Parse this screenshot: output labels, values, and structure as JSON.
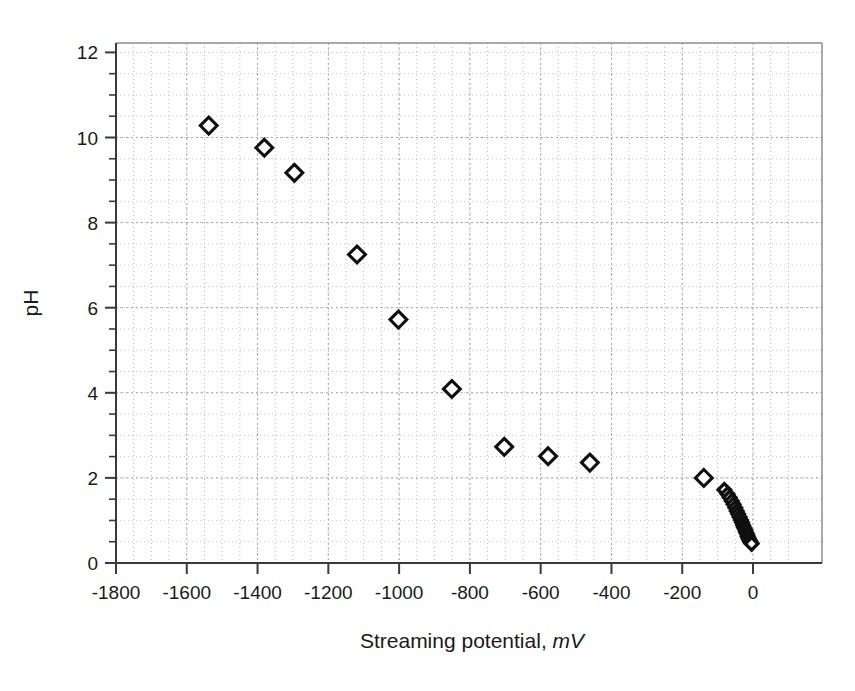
{
  "chart_data": {
    "type": "scatter",
    "title": "",
    "xlabel": "Streaming potential, mV",
    "xlabel_main": "Streaming potential,",
    "xlabel_unit": "mV",
    "ylabel": "pH",
    "xlim": [
      -1900,
      100
    ],
    "ylim": [
      0,
      12
    ],
    "xticks": [
      -1800,
      -1600,
      -1400,
      -1200,
      -1000,
      -800,
      -600,
      -400,
      -200,
      0
    ],
    "xtick_labels": [
      "-1800",
      "-1600",
      "-1400",
      "-1200",
      "-1000",
      "-800",
      "-600",
      "-400",
      "-200",
      "0"
    ],
    "yticks": [
      0,
      2,
      4,
      6,
      8,
      10,
      12
    ],
    "ytick_labels": [
      "0",
      "2",
      "4",
      "6",
      "8",
      "10",
      "12"
    ],
    "x_minor_step": 50,
    "y_minor_step": 0.5,
    "grid": "dotted-minor-and-major",
    "legend": "none",
    "marker": "open-diamond",
    "marker_fill": "#ffffff",
    "marker_edge": "#101010",
    "series": [
      {
        "name": "pH vs streaming potential",
        "points": [
          [
            -1538,
            10.28
          ],
          [
            -1381,
            9.76
          ],
          [
            -1296,
            9.17
          ],
          [
            -1119,
            7.25
          ],
          [
            -1002,
            5.72
          ],
          [
            -851,
            4.09
          ],
          [
            -703,
            2.73
          ],
          [
            -579,
            2.51
          ],
          [
            -461,
            2.36
          ],
          [
            -139,
            2.0
          ],
          [
            -81,
            1.72
          ],
          [
            -72,
            1.62
          ],
          [
            -66,
            1.54
          ],
          [
            -60,
            1.46
          ],
          [
            -55,
            1.38
          ],
          [
            -50,
            1.3
          ],
          [
            -46,
            1.22
          ],
          [
            -42,
            1.15
          ],
          [
            -38,
            1.08
          ],
          [
            -34,
            1.01
          ],
          [
            -31,
            0.95
          ],
          [
            -28,
            0.89
          ],
          [
            -25,
            0.83
          ],
          [
            -22,
            0.78
          ],
          [
            -20,
            0.73
          ],
          [
            -17,
            0.68
          ],
          [
            -15,
            0.63
          ],
          [
            -13,
            0.59
          ],
          [
            -11,
            0.55
          ],
          [
            -9,
            0.52
          ],
          [
            -7,
            0.49
          ],
          [
            -5,
            0.47
          ],
          [
            -4,
            0.45
          ]
        ]
      }
    ]
  },
  "figure": {
    "background": "#ffffff",
    "axis_color": "#3a3a3a"
  }
}
